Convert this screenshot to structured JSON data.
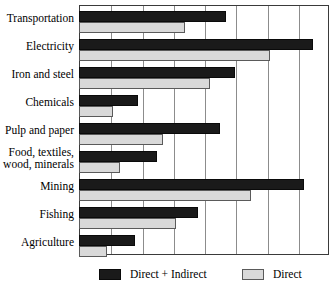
{
  "chart_data": {
    "type": "bar",
    "orientation": "horizontal",
    "title": "",
    "xlabel": "",
    "ylabel": "",
    "grid": true,
    "gridlines": 8,
    "xlim": [
      0,
      8
    ],
    "legend_position": "bottom",
    "categories": [
      "Transportation",
      "Electricity",
      "Iron and steel",
      "Chemicals",
      "Pulp and paper",
      "Food, textiles, wood, minerals",
      "Mining",
      "Fishing",
      "Agriculture"
    ],
    "category_lines": [
      [
        "Transportation"
      ],
      [
        "Electricity"
      ],
      [
        "Iron and steel"
      ],
      [
        "Chemicals"
      ],
      [
        "Pulp and paper"
      ],
      [
        "Food, textiles,",
        "wood, minerals"
      ],
      [
        "Mining"
      ],
      [
        "Fishing"
      ],
      [
        "Agriculture"
      ]
    ],
    "series": [
      {
        "name": "Direct + Indirect",
        "color": "#1a1a1a",
        "values": [
          4.7,
          7.5,
          5.0,
          1.9,
          4.5,
          2.5,
          7.2,
          3.8,
          1.8
        ]
      },
      {
        "name": "Direct",
        "color": "#d9d9d9",
        "values": [
          3.4,
          6.1,
          4.2,
          1.1,
          2.7,
          1.3,
          5.5,
          3.1,
          0.9
        ]
      }
    ]
  },
  "legend": {
    "items": [
      {
        "label": "Direct + Indirect",
        "swatch": "dark"
      },
      {
        "label": "Direct",
        "swatch": "light"
      }
    ]
  }
}
